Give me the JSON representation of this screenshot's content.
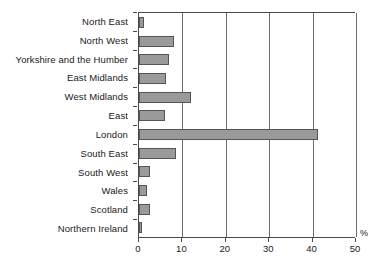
{
  "chart_data": {
    "type": "bar",
    "orientation": "horizontal",
    "title": "",
    "subtitle": "",
    "xlabel": "%",
    "ylabel": "",
    "xlim": [
      0,
      50
    ],
    "xticks": [
      0,
      10,
      20,
      30,
      40,
      50
    ],
    "xtick_labels": [
      "0",
      "10",
      "20",
      "30",
      "40",
      "50"
    ],
    "grid": true,
    "legend": false,
    "legend_position": "none",
    "bar_color": "#9a9a9a",
    "bar_edge_color": "#555555",
    "axis_color": "#4a4a4a",
    "categories": [
      "North East",
      "North West",
      "Yorkshire and the Humber",
      "East Midlands",
      "West Midlands",
      "East",
      "London",
      "South East",
      "South West",
      "Wales",
      "Scotland",
      "Northern Ireland"
    ],
    "values": [
      1.2,
      8.0,
      7.0,
      6.2,
      12.0,
      6.0,
      41.3,
      8.5,
      2.5,
      1.8,
      2.5,
      0.7
    ]
  },
  "axis": {
    "unit_label": "%"
  }
}
